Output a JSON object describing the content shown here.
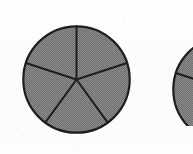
{
  "figure": {
    "kind": "fraction-circles",
    "background_color": "#fdfdfb",
    "stroke_color": "#1e1e1e",
    "fill_color": "#878787",
    "fill_pattern": "dithered-halftone-gray",
    "label_a": "",
    "label_b": "",
    "caption": ""
  },
  "chart_data": {
    "type": "pie",
    "title": "",
    "xlabel": "",
    "ylabel": "",
    "legend_position": "none",
    "grid": false,
    "charts": [
      {
        "name": "circle-a",
        "center_x": 76,
        "center_y": 79,
        "radius": 54,
        "slice_count": 5,
        "start_angle_deg": 90,
        "categories": [
          "1/5",
          "1/5",
          "1/5",
          "1/5",
          "1/5"
        ],
        "values": [
          20,
          20,
          20,
          20,
          20
        ],
        "shaded": [
          true,
          true,
          true,
          true,
          true
        ],
        "shaded_count": 5,
        "fraction_shaded": "5/5",
        "cropped": false
      },
      {
        "name": "circle-b",
        "center_x": 226,
        "center_y": 80,
        "radius": 54,
        "slice_count": 5,
        "start_angle_deg": 90,
        "categories": [
          "1/5",
          "1/5",
          "1/5",
          "1/5",
          "1/5"
        ],
        "values": [
          20,
          20,
          20,
          20,
          20
        ],
        "shaded": [
          true,
          true,
          true,
          true,
          true
        ],
        "shaded_count": 5,
        "fraction_shaded": "5/5",
        "cropped": true,
        "crop_note": "only left sliver visible at right page edge"
      }
    ]
  }
}
